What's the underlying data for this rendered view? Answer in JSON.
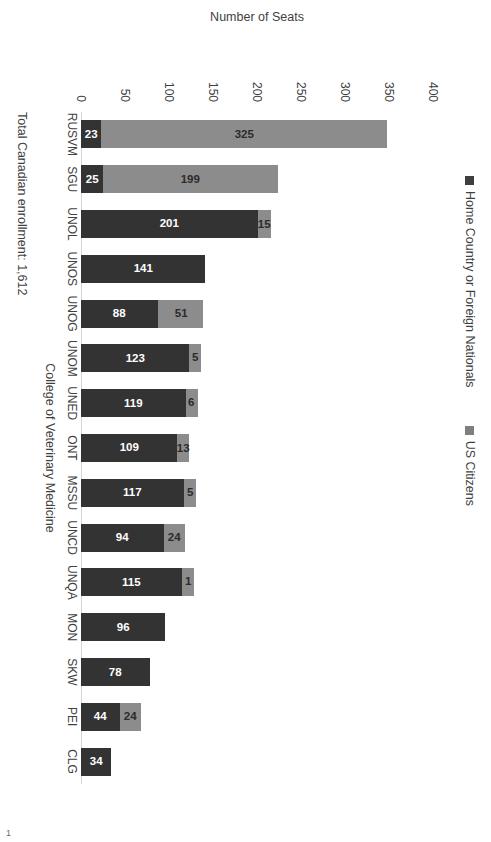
{
  "page": {
    "number": "1"
  },
  "legend": {
    "position": "top",
    "items": [
      {
        "label": "Home Country or Foreign Nationals",
        "color": "#333333",
        "swatch": "dark"
      },
      {
        "label": "US Citizens",
        "color": "#8c8c8c",
        "swatch": "grey"
      }
    ]
  },
  "footnote": "Total Canadian enrollment: 1,612",
  "axis": {
    "value_title": "Number of Seats",
    "category_title": "College of Veterinary Medicine",
    "ticks": [
      "400",
      "350",
      "300",
      "250",
      "200",
      "150",
      "100",
      "50",
      "0"
    ]
  },
  "chart_data": {
    "type": "bar",
    "orientation": "horizontal",
    "stacked": true,
    "title": "",
    "xlabel": "College of Veterinary Medicine",
    "ylabel": "Number of Seats",
    "ylim": [
      0,
      400
    ],
    "ytick_labels": [
      "0",
      "50",
      "100",
      "150",
      "200",
      "250",
      "300",
      "350",
      "400"
    ],
    "grid": false,
    "legend_position": "top",
    "categories": [
      "RUSVM",
      "SGU",
      "UNOL",
      "UNOS",
      "UNOG",
      "UNOM",
      "UNED",
      "ONT",
      "MSSU",
      "UNCD",
      "UNQA",
      "MON",
      "SKW",
      "PEI",
      "CLG"
    ],
    "series": [
      {
        "name": "Home Country or Foreign Nationals",
        "color": "#333333",
        "values": [
          23,
          25,
          201,
          141,
          88,
          123,
          119,
          109,
          117,
          94,
          115,
          96,
          78,
          44,
          34
        ]
      },
      {
        "name": "US Citizens",
        "color": "#8c8c8c",
        "values": [
          325,
          199,
          15,
          0,
          51,
          5,
          6,
          13,
          5,
          24,
          1,
          0,
          0,
          24,
          0
        ]
      }
    ],
    "annotation": "Total Canadian enrollment: 1,612"
  }
}
